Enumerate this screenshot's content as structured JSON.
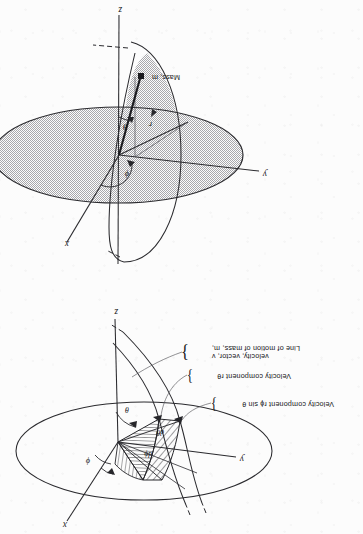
{
  "figure": {
    "orientation_deg": 180,
    "ink_color": "#17171a",
    "paper_color": "#fcfcfc",
    "shade_color": "#c9c9c9"
  },
  "top_diagram": {
    "name": "velocity-components-diagram",
    "axes": {
      "x": "x",
      "y": "y",
      "z": "z"
    },
    "angles": {
      "phi": "ϕ",
      "theta": "θ",
      "dphi": "dϕ",
      "dtheta": "dθ"
    },
    "callouts": [
      {
        "id": "c1",
        "text": "Velocity component rϕ sin θ"
      },
      {
        "id": "c2",
        "text": "Velocity component rθ"
      },
      {
        "id": "c3",
        "line1": "Line of motion of mass, m,",
        "line2": "velocity, vector, v"
      }
    ]
  },
  "bottom_diagram": {
    "name": "spherical-coordinates-diagram",
    "axes": {
      "x": "x",
      "y": "y",
      "z": "z"
    },
    "angles": {
      "phi": "ϕ",
      "theta": "θ"
    },
    "radius_label": "r",
    "mass_label": "Mass, m"
  }
}
